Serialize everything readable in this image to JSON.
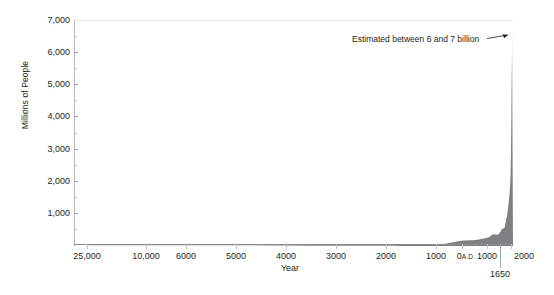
{
  "chart_data": {
    "type": "area",
    "title": "",
    "xlabel": "Year",
    "ylabel": "Millions of People",
    "ylim": [
      0,
      7000
    ],
    "grid": false,
    "legend": null,
    "annotations": [
      {
        "text": "Estimated between 6 and 7 billion",
        "points_to": "present-day peak of curve"
      }
    ],
    "y_ticks": [
      {
        "value": 7000,
        "label": "7,000"
      },
      {
        "value": 6000,
        "label": "6,000"
      },
      {
        "value": 5000,
        "label": "5,000"
      },
      {
        "value": 4000,
        "label": "4,000"
      },
      {
        "value": 3000,
        "label": "3,000"
      },
      {
        "value": 2000,
        "label": "2,000"
      },
      {
        "value": 1000,
        "label": "1,000"
      }
    ],
    "y_minor_ticks": [
      6500,
      5500,
      4500,
      3500,
      2500,
      1500,
      500
    ],
    "x_ticks": [
      {
        "label": "25,000",
        "suffix": ""
      },
      {
        "label": "10,000",
        "suffix": ""
      },
      {
        "label": "6000",
        "suffix": ""
      },
      {
        "label": "5000",
        "suffix": ""
      },
      {
        "label": "4000",
        "suffix": ""
      },
      {
        "label": "3000",
        "suffix": ""
      },
      {
        "label": "2000",
        "suffix": ""
      },
      {
        "label": "1000",
        "suffix": ""
      },
      {
        "label": "0",
        "suffix": "A.D."
      },
      {
        "label": "1000",
        "suffix": ""
      },
      {
        "label": "2000",
        "suffix": ""
      }
    ],
    "x_callout": {
      "label": "1650"
    },
    "series": [
      {
        "name": "World population",
        "color": "#808083",
        "x": [
          "25000 B.C.",
          "10000 B.C.",
          "8000 B.C.",
          "6000 B.C.",
          "5000 B.C.",
          "4000 B.C.",
          "3000 B.C.",
          "2000 B.C.",
          "1000 B.C.",
          "500 B.C.",
          "0 A.D.",
          "500 A.D.",
          "1000 A.D.",
          "1200 A.D.",
          "1400 A.D.",
          "1500 A.D.",
          "1600 A.D.",
          "1650 A.D.",
          "1700 A.D.",
          "1750 A.D.",
          "1800 A.D.",
          "1850 A.D.",
          "1900 A.D.",
          "1925 A.D.",
          "1950 A.D.",
          "1975 A.D.",
          "2000 A.D.",
          "2010 A.D."
        ],
        "values": [
          3,
          4,
          5,
          7,
          10,
          14,
          20,
          27,
          50,
          100,
          170,
          190,
          265,
          360,
          350,
          425,
          545,
          545,
          600,
          790,
          980,
          1260,
          1650,
          1950,
          2520,
          4070,
          6080,
          6900
        ],
        "units": "millions of people"
      }
    ]
  },
  "axes": {
    "ylabel": "Millions of People",
    "xlabel": "Year"
  },
  "annotation": {
    "text": "Estimated between 6 and 7 billion"
  },
  "callout": {
    "label": "1650"
  },
  "colors": {
    "fill": "#808083",
    "axis": "#8a8a8c",
    "text": "#231f20"
  }
}
